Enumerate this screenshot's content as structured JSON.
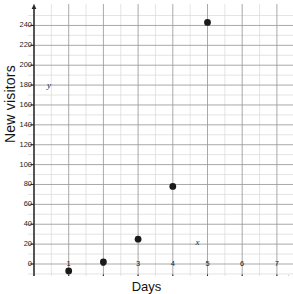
{
  "chart_data": {
    "type": "scatter",
    "title": "",
    "xlabel": "Days",
    "ylabel": "New visitors",
    "x": [
      1,
      2,
      3,
      4,
      5
    ],
    "values": [
      -7,
      2,
      25,
      78,
      243
    ],
    "points": [
      {
        "x": 1,
        "y": -7
      },
      {
        "x": 2,
        "y": 2
      },
      {
        "x": 3,
        "y": 25
      },
      {
        "x": 4,
        "y": 78
      },
      {
        "x": 5,
        "y": 243
      }
    ],
    "xlim": [
      0,
      7.6
    ],
    "ylim": [
      -20,
      250
    ],
    "xticks": [
      1,
      2,
      3,
      4,
      5,
      6,
      7
    ],
    "yticks": [
      0,
      20,
      40,
      60,
      80,
      100,
      120,
      140,
      160,
      180,
      200,
      220,
      240
    ],
    "grid": true,
    "minor_grid": true,
    "legend": "none",
    "marker_color": "#1a1a1a",
    "grid_color": "#9a9a9a",
    "minor_grid_color": "#d8d8d8",
    "axis_color": "#2b2b2b"
  },
  "axis": {
    "y_title": "New visitors",
    "x_title": "Days",
    "y_tick_labels": [
      "240",
      "220",
      "200",
      "180",
      "160",
      "140",
      "120",
      "100",
      "80",
      "60",
      "40",
      "20",
      "0"
    ],
    "x_tick_labels": [
      "1",
      "2",
      "3",
      "4",
      "5",
      "6",
      "7"
    ],
    "x_var_label": "x",
    "y_var_label": "y"
  }
}
